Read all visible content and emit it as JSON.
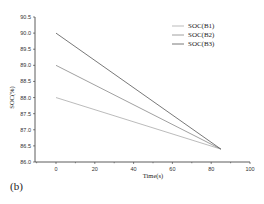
{
  "panel_label": "(b)",
  "chart_data": {
    "type": "line",
    "title": "",
    "xlabel": "Time(s)",
    "ylabel": "SOC(%)",
    "xlim": [
      -10,
      100
    ],
    "ylim": [
      86.0,
      90.5
    ],
    "x_ticks": [
      "0",
      "20",
      "40",
      "60",
      "80",
      "100"
    ],
    "y_ticks": [
      "86.0",
      "86.5",
      "87.0",
      "87.5",
      "88.0",
      "88.5",
      "89.0",
      "89.5",
      "90.0",
      "90.5"
    ],
    "grid": false,
    "legend_position": "top-right",
    "series": [
      {
        "name": "SOC(B1)",
        "color": "#aaaaaa",
        "x": [
          0,
          85
        ],
        "y": [
          88.0,
          86.4
        ]
      },
      {
        "name": "SOC(B2)",
        "color": "#888888",
        "x": [
          0,
          85
        ],
        "y": [
          89.0,
          86.4
        ]
      },
      {
        "name": "SOC(B3)",
        "color": "#555555",
        "x": [
          0,
          85
        ],
        "y": [
          90.0,
          86.4
        ]
      }
    ]
  }
}
